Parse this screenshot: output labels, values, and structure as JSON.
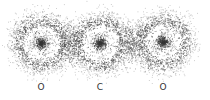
{
  "diagram": {
    "molecule": "CO2 electron density",
    "atoms": [
      {
        "label": "O",
        "x": 41,
        "y": 43
      },
      {
        "label": "C",
        "x": 100,
        "y": 43
      },
      {
        "label": "O",
        "x": 163,
        "y": 42
      }
    ],
    "label_y": 82,
    "ring_radius": 22,
    "core_radius": 6,
    "dot_color": "#3a3a3a"
  }
}
